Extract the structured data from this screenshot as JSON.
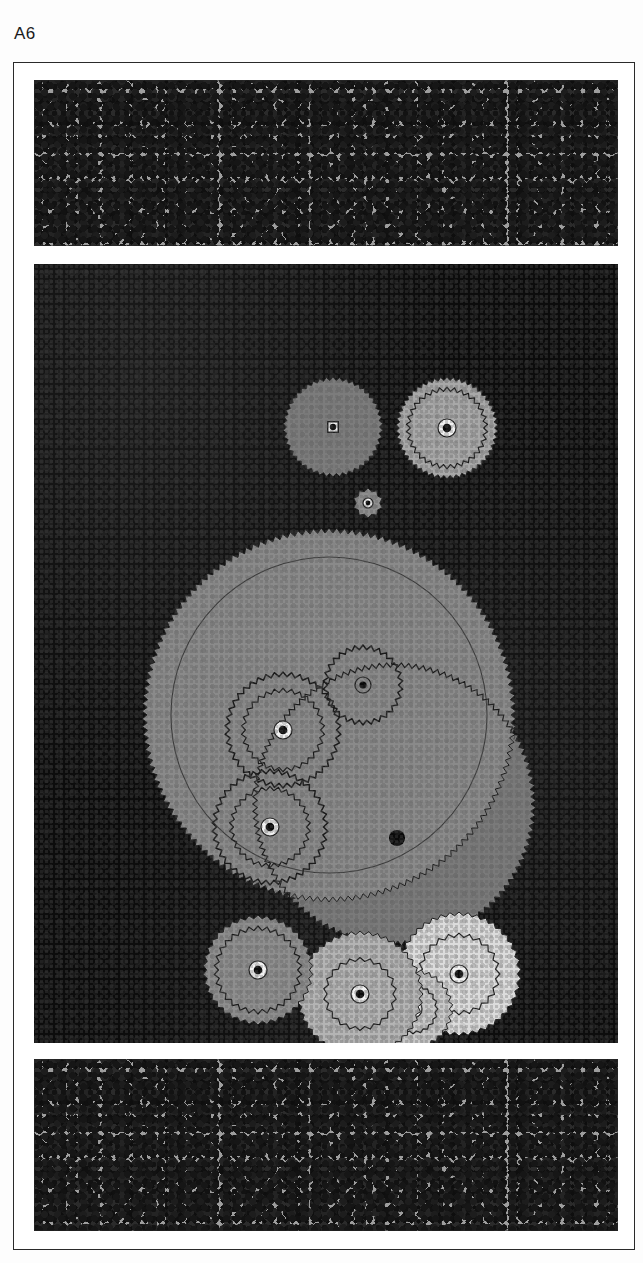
{
  "plate": {
    "label": "A6",
    "caption_text": "A6"
  },
  "frame": {
    "border_color": "#2a2a2a",
    "mat_color": "#ffffff"
  },
  "bands": {
    "top": {
      "name": "speckled-stone-texture",
      "fill": "#9e9e9e",
      "speck_color": "#161616"
    },
    "bottom": {
      "name": "speckled-stone-texture",
      "fill": "#9e9e9e",
      "speck_color": "#161616"
    }
  },
  "panel": {
    "background": "#0c0c0c",
    "description": "dark felt background with gear assembly"
  },
  "palette": {
    "gear_dark_gray": "#7c7c7c",
    "gear_mid_gray": "#8e8e8e",
    "gear_light_gray": "#a8a8a8",
    "gear_pale_gray": "#c8c8c8",
    "gear_white_gray": "#dcdcdc",
    "big_disc_gray": "#8a8a8a",
    "big_disc_shadow_gray": "#7a7a7a",
    "outline": "#1a1a1a",
    "hub_ring": "#f2f2f2",
    "hub_center": "#0a0a0a"
  },
  "chart_data": {
    "type": "scatter",
    "title": "A6",
    "xlabel": "",
    "ylabel": "",
    "categories": [
      "gear-top-left",
      "gear-top-right",
      "gear-tiny-center",
      "gear-main-large",
      "gear-secondary-disc",
      "planet-upper-right",
      "planet-upper-left",
      "planet-lower-left",
      "pin-lower-right",
      "gear-bottom-1",
      "gear-bottom-2",
      "gear-bottom-3",
      "gear-bottom-4"
    ],
    "values": [
      50,
      51,
      15,
      187,
      142,
      40,
      58,
      58,
      8,
      55,
      63,
      40,
      62
    ],
    "series": [
      {
        "name": "radius_px",
        "values": [
          50,
          51,
          15,
          187,
          142,
          40,
          58,
          58,
          8,
          55,
          63,
          40,
          62
        ]
      },
      {
        "name": "center_x_px",
        "values": [
          299,
          413,
          334,
          295,
          360,
          329,
          249,
          236,
          363,
          224,
          326,
          379,
          425
        ]
      },
      {
        "name": "center_y_px",
        "values": [
          163,
          164,
          239,
          451,
          540,
          421,
          466,
          563,
          574,
          706,
          730,
          745,
          710
        ]
      }
    ],
    "grid": false,
    "legend": "none"
  },
  "gears": [
    {
      "id": "gear-top-left",
      "name": "gear-with-square-hub",
      "fill": "#7c7c7c",
      "teeth": 46,
      "hub": "square"
    },
    {
      "id": "gear-top-right",
      "name": "gear-with-inner-ring",
      "fill": "#a0a0a0",
      "teeth": 48,
      "hub": "round-ring"
    },
    {
      "id": "gear-tiny-center",
      "name": "pinion-gear",
      "fill": "#8a8a8a",
      "teeth": 12,
      "hub": "round"
    },
    {
      "id": "gear-main-large",
      "name": "main-ring-gear",
      "fill": "#8a8a8a",
      "teeth": 150,
      "hub": "none"
    },
    {
      "id": "gear-secondary-disc",
      "name": "secondary-ring-gear",
      "fill": "#7e7e7e",
      "teeth": 120,
      "hub": "none"
    },
    {
      "id": "planet-upper-right",
      "name": "planet-gear-outline",
      "fill": "none",
      "teeth": 30,
      "hub": "round"
    },
    {
      "id": "planet-upper-left",
      "name": "compound-planet-outline",
      "fill": "none",
      "teeth": 40,
      "hub": "round"
    },
    {
      "id": "planet-lower-left",
      "name": "compound-planet-outline",
      "fill": "none",
      "teeth": 40,
      "hub": "round"
    },
    {
      "id": "pin-lower-right",
      "name": "pivot-pin",
      "fill": "#0a0a0a",
      "teeth": 0,
      "hub": "round"
    },
    {
      "id": "gear-bottom-1",
      "name": "output-gear-dark",
      "fill": "#8a8a8a",
      "teeth": 36,
      "hub": "round"
    },
    {
      "id": "gear-bottom-2",
      "name": "output-gear-mid",
      "fill": "#b4b4b4",
      "teeth": 42,
      "hub": "round"
    },
    {
      "id": "gear-bottom-3",
      "name": "output-gear-pale",
      "fill": "#cfcfcf",
      "teeth": 28,
      "hub": "round"
    },
    {
      "id": "gear-bottom-4",
      "name": "output-gear-light",
      "fill": "#dcdcdc",
      "teeth": 40,
      "hub": "round"
    }
  ]
}
